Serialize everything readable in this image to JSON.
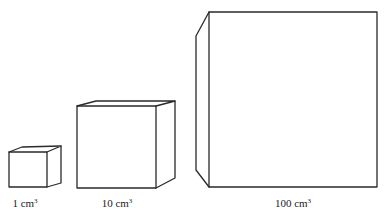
{
  "diagram": {
    "type": "cube-volume-comparison",
    "stroke_color": "#2a2a2a",
    "background": "#ffffff",
    "cubes": [
      {
        "id": "small",
        "label_value": "1 cm",
        "label_exponent": "3",
        "label_full": "1 cm³",
        "label_pos": {
          "x": 25,
          "y": 198
        }
      },
      {
        "id": "medium",
        "label_value": "10 cm",
        "label_exponent": "3",
        "label_full": "10 cm³",
        "label_pos": {
          "x": 117,
          "y": 198
        }
      },
      {
        "id": "large",
        "label_value": "100 cm",
        "label_exponent": "3",
        "label_full": "100 cm³",
        "label_pos": {
          "x": 293,
          "y": 198
        }
      }
    ]
  }
}
